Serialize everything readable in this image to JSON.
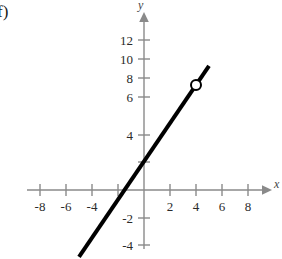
{
  "figure": {
    "part_label": "f)",
    "background_color": "#ffffff",
    "axis_color": "#8a8a8a",
    "curve_color": "#000000",
    "tick_label_color": "#2a2a2a",
    "axis_name_color": "#444444",
    "x_axis_name": "x",
    "y_axis_name": "y"
  },
  "chart_data": {
    "type": "line",
    "title": "",
    "xlabel": "x",
    "ylabel": "y",
    "xlim": [
      -9.5,
      9.5
    ],
    "ylim": [
      -5.5,
      13.5
    ],
    "grid": false,
    "legend": "none",
    "x_ticks": [
      -8,
      -6,
      -4,
      -2,
      2,
      4,
      6,
      8
    ],
    "x_tick_labels": [
      "-8",
      "-6",
      "-4",
      "",
      "2",
      "4",
      "6",
      "8"
    ],
    "y_ticks": [
      -4,
      -2,
      2,
      4,
      6,
      8,
      10,
      12
    ],
    "y_tick_labels": [
      "-4",
      "-2",
      "",
      "4",
      "6",
      "8",
      "10",
      "12"
    ],
    "series": [
      {
        "name": "line",
        "equation": "y = 2x + 3",
        "slope": 2,
        "intercept": 3,
        "x": [
          -5,
          5
        ],
        "values": [
          -7,
          13
        ],
        "style": "solid",
        "width": 4,
        "color": "#000000"
      }
    ],
    "markers": [
      {
        "name": "open-circle",
        "x": 4,
        "y": 11,
        "filled": false,
        "radius": 5,
        "color": "#000000"
      }
    ],
    "annotations": [
      {
        "name": "part-label",
        "text": "f)",
        "x": -9.4,
        "y": 13.2
      }
    ]
  }
}
